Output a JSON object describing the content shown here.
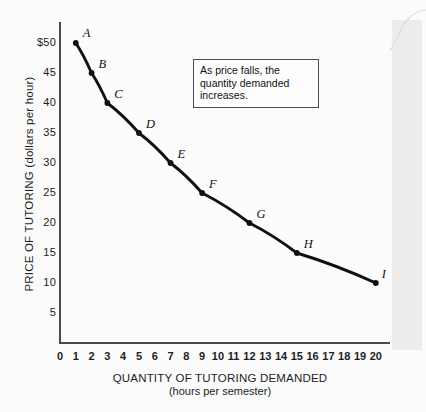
{
  "chart_data": {
    "type": "line",
    "title": "",
    "xlabel": "QUANTITY OF TUTORING DEMANDED",
    "xlabel_sub": "(hours per semester)",
    "ylabel": "PRICE OF TUTORING (dollars per hour)",
    "xlim": [
      0,
      20.9
    ],
    "ylim": [
      0,
      53.5
    ],
    "grid": false,
    "legend": "none",
    "x_tick_labels": [
      "0",
      "1",
      "2",
      "3",
      "4",
      "5",
      "6",
      "7",
      "8",
      "9",
      "10",
      "11",
      "12",
      "13",
      "14",
      "15",
      "16",
      "17",
      "18",
      "19",
      "20"
    ],
    "x_ticks": [
      0,
      1,
      2,
      3,
      4,
      5,
      6,
      7,
      8,
      9,
      10,
      11,
      12,
      13,
      14,
      15,
      16,
      17,
      18,
      19,
      20
    ],
    "y_tick_labels": [
      "5",
      "10",
      "15",
      "20",
      "25",
      "30",
      "35",
      "40",
      "45",
      "$50"
    ],
    "y_ticks": [
      5,
      10,
      15,
      20,
      25,
      30,
      35,
      40,
      45,
      50
    ],
    "series": [
      {
        "name": "Demand curve",
        "color": "#101010",
        "points": [
          {
            "label": "A",
            "x": 1,
            "y": 50
          },
          {
            "label": "B",
            "x": 2,
            "y": 45
          },
          {
            "label": "C",
            "x": 3,
            "y": 40
          },
          {
            "label": "D",
            "x": 5,
            "y": 35
          },
          {
            "label": "E",
            "x": 7,
            "y": 30
          },
          {
            "label": "F",
            "x": 9,
            "y": 25
          },
          {
            "label": "G",
            "x": 12,
            "y": 20
          },
          {
            "label": "H",
            "x": 15,
            "y": 15
          },
          {
            "label": "I",
            "x": 20,
            "y": 10
          }
        ]
      }
    ],
    "annotations": [
      {
        "id": "callout",
        "line1": "As price falls, the quantity",
        "line2": "demanded increases."
      }
    ]
  },
  "colors": {
    "curve": "#101010",
    "axis": "#4a4a4a",
    "text": "#1d1d1d",
    "callout_border": "#4d4d4d",
    "page_background": "#fbfbfb"
  }
}
